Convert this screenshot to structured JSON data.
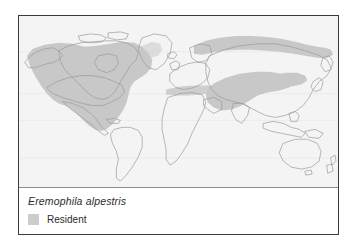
{
  "figure": {
    "species_name": "Eremophila alpestris",
    "frame_border_color": "#3a3a3a",
    "page_background": "#ffffff"
  },
  "map": {
    "ocean_color": "#f4f4f4",
    "land_color": "#fbfbfb",
    "coastline_color": "#9a9a9a",
    "graticule_color": "#e4e4e4",
    "range_color": "#c8c8c8",
    "projection": "equirectangular-world",
    "regions_shaded": [
      "North America",
      "Arctic Eurasian coast",
      "Central Asia",
      "Mediterranean and Middle East"
    ]
  },
  "legend": {
    "items": [
      {
        "label": "Resident",
        "color": "#cccccc"
      }
    ]
  }
}
